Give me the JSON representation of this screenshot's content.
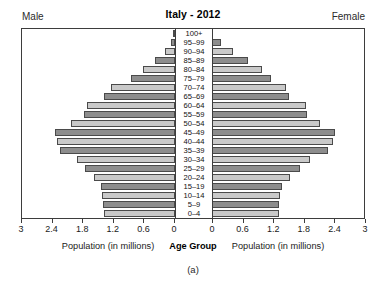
{
  "header": {
    "title": "Italy - 2012",
    "male_label": "Male",
    "female_label": "Female"
  },
  "axis": {
    "left_title": "Population (in millions)",
    "center_title": "Age Group",
    "right_title": "Population (in millions)",
    "left_ticks": [
      "3",
      "2.4",
      "1.8",
      "1.2",
      "0.6",
      "0"
    ],
    "right_ticks": [
      "0",
      "0.6",
      "1.2",
      "1.8",
      "2.4",
      "3"
    ]
  },
  "caption": "(a)",
  "colors": {
    "bar_dark": "#8d8d8d",
    "bar_light": "#c9c9c9",
    "bar_outline": "#4a4a4a",
    "frame": "#3d3d3d",
    "text": "#1a1a1a"
  },
  "chart_data": {
    "type": "bar",
    "subtype": "population-pyramid",
    "title": "Italy - 2012",
    "xlabel": "Population (in millions)",
    "ylabel": "Age Group",
    "xlim": [
      0,
      3
    ],
    "xticks": [
      0,
      0.6,
      1.2,
      1.8,
      2.4,
      3
    ],
    "grid": false,
    "legend": false,
    "orientation": "horizontal-mirrored",
    "categories": [
      "100+",
      "95-99",
      "90-94",
      "85-89",
      "80-84",
      "75-79",
      "70-74",
      "65-69",
      "60-64",
      "55-59",
      "50-54",
      "45-49",
      "40-44",
      "35-39",
      "30-34",
      "25-29",
      "20-24",
      "15-19",
      "10-14",
      "5-9",
      "0-4"
    ],
    "series": [
      {
        "name": "Male",
        "side": "left",
        "units": "millions",
        "values": [
          0.01,
          0.07,
          0.19,
          0.4,
          0.62,
          0.87,
          1.26,
          1.4,
          1.72,
          1.79,
          2.04,
          2.35,
          2.32,
          2.25,
          1.92,
          1.76,
          1.59,
          1.46,
          1.44,
          1.41,
          1.4
        ]
      },
      {
        "name": "Female",
        "side": "right",
        "units": "millions",
        "values": [
          0.04,
          0.2,
          0.43,
          0.72,
          1.0,
          1.18,
          1.48,
          1.53,
          1.86,
          1.88,
          2.13,
          2.43,
          2.39,
          2.3,
          1.94,
          1.74,
          1.54,
          1.39,
          1.36,
          1.34,
          1.33
        ]
      }
    ]
  }
}
